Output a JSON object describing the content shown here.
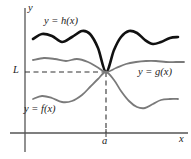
{
  "figure": {
    "labels": {
      "curve_h": "y = h(x)",
      "curve_g": "y = g(x)",
      "curve_f": "y = f(x)",
      "y_limit": "L",
      "x_point": "a",
      "y_axis": "y",
      "x_axis": "x"
    },
    "colors": {
      "curve_h": "#111111",
      "curve_g": "#7a7a7a",
      "curve_f": "#7a7a7a",
      "axis": "#555555",
      "dashed": "#333333",
      "background": "#ffffff"
    }
  },
  "chart_data": {
    "type": "line",
    "title": "",
    "xlabel": "x",
    "ylabel": "y",
    "grid": false,
    "legend": "inline-annotations",
    "annotations": [
      {
        "text": "y = h(x)",
        "x_px": 44,
        "y_px": 16
      },
      {
        "text": "y = g(x)",
        "x_px": 138,
        "y_px": 67
      },
      {
        "text": "y = f(x)",
        "x_px": 24,
        "y_px": 104
      },
      {
        "text": "L",
        "x_px": 13,
        "y_px": 65
      },
      {
        "text": "a",
        "x_px": 102,
        "y_px": 136
      },
      {
        "text": "y",
        "x_px": 28,
        "y_px": 3
      },
      {
        "text": "x",
        "x_px": 179,
        "y_px": 134
      }
    ],
    "axis_pixels": {
      "y_axis_x": 25,
      "x_axis_y": 133,
      "x_min": 10,
      "x_max": 188,
      "y_top": 8,
      "y_bottom": 152
    },
    "common_point": {
      "x": "a",
      "y": "L",
      "x_px": 106,
      "y_px": 72
    },
    "series": [
      {
        "name": "y = h(x)",
        "role": "upper-bound",
        "color": "#111111",
        "width": 2.6,
        "points_px": [
          [
            33,
            39
          ],
          [
            42,
            34
          ],
          [
            52,
            36
          ],
          [
            62,
            42
          ],
          [
            72,
            37
          ],
          [
            82,
            31
          ],
          [
            90,
            34
          ],
          [
            98,
            48
          ],
          [
            106,
            72
          ],
          [
            114,
            50
          ],
          [
            121,
            37
          ],
          [
            129,
            31
          ],
          [
            137,
            33
          ],
          [
            145,
            40
          ],
          [
            153,
            44
          ],
          [
            161,
            42
          ],
          [
            170,
            38
          ],
          [
            178,
            37
          ]
        ]
      },
      {
        "name": "y = g(x)",
        "role": "middle",
        "color": "#7a7a7a",
        "width": 1.8,
        "points_px": [
          [
            33,
            60
          ],
          [
            44,
            58
          ],
          [
            55,
            59
          ],
          [
            66,
            61
          ],
          [
            77,
            59
          ],
          [
            88,
            62
          ],
          [
            97,
            67
          ],
          [
            106,
            72
          ],
          [
            116,
            68
          ],
          [
            126,
            64
          ],
          [
            136,
            62
          ],
          [
            146,
            61
          ],
          [
            156,
            61
          ],
          [
            166,
            62
          ],
          [
            176,
            62
          ],
          [
            184,
            62
          ]
        ]
      },
      {
        "name": "y = f(x)",
        "role": "lower-bound",
        "color": "#7a7a7a",
        "width": 1.8,
        "points_px": [
          [
            33,
            99
          ],
          [
            42,
            96
          ],
          [
            52,
            98
          ],
          [
            62,
            102
          ],
          [
            72,
            101
          ],
          [
            82,
            95
          ],
          [
            90,
            87
          ],
          [
            98,
            79
          ],
          [
            106,
            72
          ],
          [
            114,
            80
          ],
          [
            121,
            91
          ],
          [
            129,
            101
          ],
          [
            137,
            107
          ],
          [
            145,
            108
          ],
          [
            153,
            104
          ],
          [
            161,
            100
          ],
          [
            170,
            99
          ],
          [
            178,
            99
          ]
        ]
      }
    ]
  }
}
